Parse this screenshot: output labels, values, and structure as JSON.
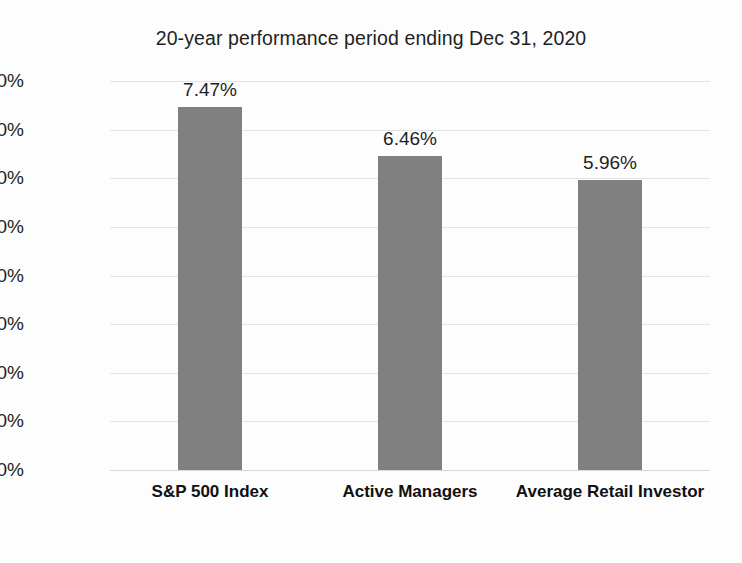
{
  "chart_data": {
    "type": "bar",
    "title": "20-year performance period ending Dec 31, 2020",
    "subtitle": "",
    "xlabel": "",
    "ylabel": "",
    "categories": [
      "S&P 500 Index",
      "Active Managers",
      "Average Retail Investor"
    ],
    "values": [
      7.47,
      6.46,
      5.96
    ],
    "value_labels": [
      "7.47%",
      "6.46%",
      "5.96%"
    ],
    "ylim": [
      0,
      8
    ],
    "ytick_values": [
      0,
      1,
      2,
      3,
      4,
      5,
      6,
      7,
      8
    ],
    "ytick_labels": [
      "0.00%",
      "1.00%",
      "2.00%",
      "3.00%",
      "4.00%",
      "5.00%",
      "6.00%",
      "7.00%",
      "8.00%"
    ],
    "grid": true,
    "legend": false,
    "legend_position": "none",
    "series": [
      {
        "name": "20-year annualized return",
        "values": [
          7.47,
          6.46,
          5.96
        ],
        "color": "#808080"
      }
    ],
    "colors": {
      "bar": "#808080",
      "gridline": "#e3e3e3",
      "baseline": "#d8d8d8",
      "text": "#1f1f1f",
      "background": "#fdfdfd"
    }
  }
}
